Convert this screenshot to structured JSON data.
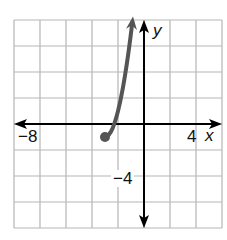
{
  "chart_data": {
    "type": "line",
    "title": "",
    "xlabel": "x",
    "ylabel": "y",
    "xlim": [
      -10,
      6
    ],
    "ylim": [
      -8,
      8
    ],
    "grid": true,
    "grid_step": 2,
    "tick_labels": {
      "x": [
        {
          "value": -8,
          "label": "−8"
        },
        {
          "value": 4,
          "label": "4"
        }
      ],
      "y": [
        {
          "value": -4,
          "label": "−4"
        }
      ]
    },
    "series": [
      {
        "name": "curve",
        "color": "#555555",
        "start_point": {
          "x": -3,
          "y": -1,
          "marker": "closed-dot"
        },
        "end": "arrow",
        "points": [
          {
            "x": -3,
            "y": -1
          },
          {
            "x": -2.5,
            "y": -0.5
          },
          {
            "x": -2,
            "y": 1
          },
          {
            "x": -1.5,
            "y": 3.5
          },
          {
            "x": -1,
            "y": 7
          },
          {
            "x": -0.9,
            "y": 7.8
          }
        ]
      }
    ],
    "axis_color": "#000000",
    "grid_color": "#b5b5b5"
  },
  "labels": {
    "x_axis": "x",
    "y_axis": "y",
    "x_neg8": "−8",
    "x_4": "4",
    "y_neg4": "−4"
  }
}
